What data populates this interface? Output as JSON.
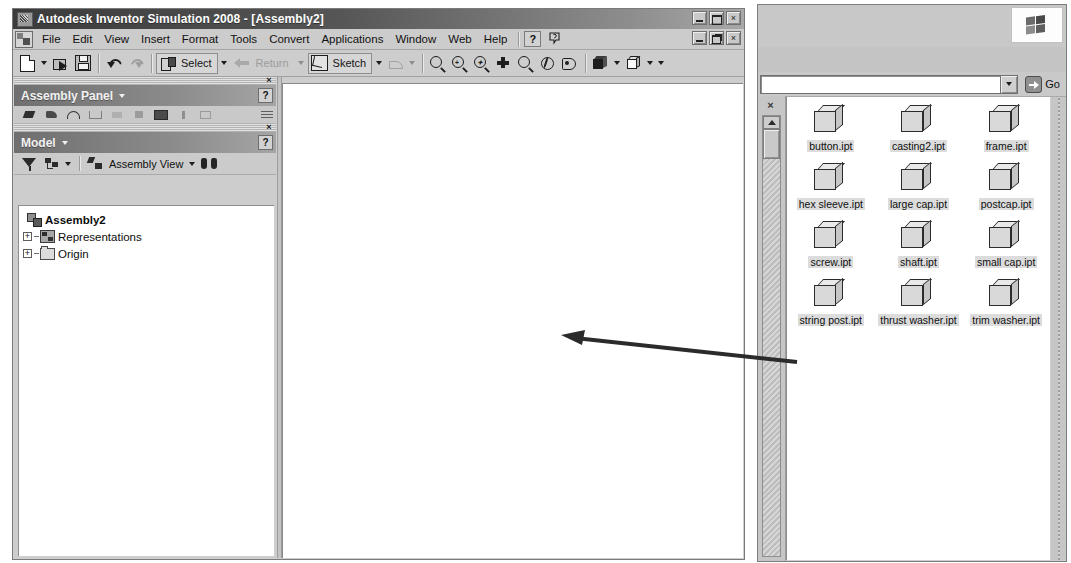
{
  "app": {
    "title": "Autodesk Inventor Simulation 2008 - [Assembly2]",
    "window_icon": "inventor-logo-icon",
    "title_buttons": [
      {
        "name": "minimize",
        "glyph": "_"
      },
      {
        "name": "maximize",
        "glyph": "□"
      },
      {
        "name": "close",
        "glyph": "×"
      }
    ],
    "mdi_buttons": [
      {
        "name": "minimize",
        "glyph": "_"
      },
      {
        "name": "restore",
        "glyph": "❐"
      },
      {
        "name": "close",
        "glyph": "×"
      }
    ]
  },
  "menu": {
    "items": [
      {
        "label": "File"
      },
      {
        "label": "Edit"
      },
      {
        "label": "View"
      },
      {
        "label": "Insert"
      },
      {
        "label": "Format"
      },
      {
        "label": "Tools"
      },
      {
        "label": "Convert"
      },
      {
        "label": "Applications"
      },
      {
        "label": "Window"
      },
      {
        "label": "Web"
      },
      {
        "label": "Help"
      }
    ],
    "help_button": "?",
    "whats_this_icon": "whats-this-icon"
  },
  "toolbar": {
    "new_label": "New",
    "open_label": "Open",
    "save_label": "Save",
    "undo_label": "Undo",
    "redo_label": "Redo",
    "select_label": "Select",
    "return_label": "Return",
    "sketch_label": "Sketch",
    "dimension_label": "Dimension",
    "zoom_all_label": "Zoom All",
    "zoom_window_label": "Zoom Window",
    "zoom_selected_label": "Zoom Selected",
    "pan_label": "Pan",
    "zoom_label": "Zoom",
    "rotate_label": "Rotate",
    "look_at_label": "Look At",
    "display_label": "Shaded Display",
    "shadow_label": "Shadow"
  },
  "assembly_panel": {
    "title": "Assembly Panel",
    "help": "?",
    "close": "×"
  },
  "model_panel": {
    "title": "Model",
    "help": "?",
    "close": "×",
    "toolbar": {
      "filter_label": "Filter",
      "tree_label": "Browser Filters",
      "view_label": "Assembly View",
      "find_label": "Find"
    },
    "tree": [
      {
        "label": "Assembly2",
        "icon": "assembly-icon",
        "bold": true,
        "expander": ""
      },
      {
        "label": "Representations",
        "icon": "representations-icon",
        "bold": false,
        "expander": "+"
      },
      {
        "label": "Origin",
        "icon": "folder-icon",
        "bold": false,
        "expander": "+"
      }
    ]
  },
  "explorer": {
    "logo": "windows-flag-icon",
    "address_value": "",
    "address_dropdown": "chevron-down-icon",
    "go_label": "Go",
    "sidebar_close": "×",
    "files": [
      {
        "name": "button.ipt"
      },
      {
        "name": "casting2.ipt"
      },
      {
        "name": "frame.ipt"
      },
      {
        "name": "hex sleeve.ipt"
      },
      {
        "name": "large cap.ipt"
      },
      {
        "name": "postcap.ipt"
      },
      {
        "name": "screw.ipt"
      },
      {
        "name": "shaft.ipt"
      },
      {
        "name": "small cap.ipt"
      },
      {
        "name": "string post.ipt"
      },
      {
        "name": "thrust washer.ipt"
      },
      {
        "name": "trim washer.ipt"
      }
    ]
  },
  "annotation": {
    "arrow_direction": "left",
    "arrow_color": "#2b2b2b"
  },
  "colors": {
    "titlebar_dark": "#3b3b3b",
    "panel_header": "#8b8b8b",
    "chrome": "#cdcdcd",
    "canvas": "#ffffff",
    "file_label_bg": "#dcdcdc"
  }
}
